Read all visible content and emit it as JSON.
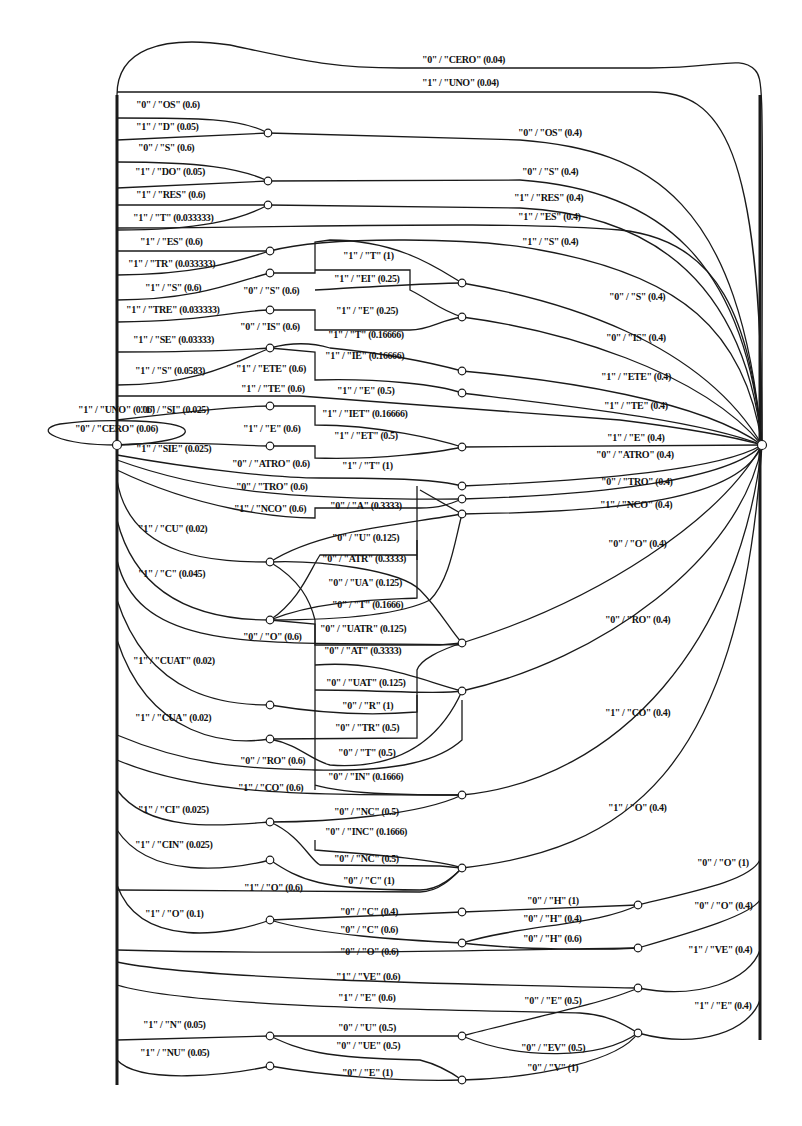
{
  "diagram": {
    "type": "weighted finite-state transducer",
    "colors": {
      "ink": "#1a1a1a",
      "background": "#ffffff"
    },
    "nodes": [
      {
        "id": "start",
        "x": 117,
        "y": 445
      },
      {
        "id": "final",
        "x": 762,
        "y": 445
      },
      {
        "id": "n1",
        "x": 268,
        "y": 133
      },
      {
        "id": "n2",
        "x": 268,
        "y": 181
      },
      {
        "id": "n3",
        "x": 268,
        "y": 205
      },
      {
        "id": "n4",
        "x": 270,
        "y": 251
      },
      {
        "id": "n5",
        "x": 270,
        "y": 273
      },
      {
        "id": "n6",
        "x": 270,
        "y": 310
      },
      {
        "id": "n7",
        "x": 270,
        "y": 348
      },
      {
        "id": "n8",
        "x": 270,
        "y": 406
      },
      {
        "id": "n9",
        "x": 270,
        "y": 446
      },
      {
        "id": "n10",
        "x": 462,
        "y": 283
      },
      {
        "id": "n11",
        "x": 462,
        "y": 317
      },
      {
        "id": "n12",
        "x": 462,
        "y": 371
      },
      {
        "id": "n13",
        "x": 462,
        "y": 393
      },
      {
        "id": "n14",
        "x": 462,
        "y": 447
      },
      {
        "id": "n15",
        "x": 462,
        "y": 486
      },
      {
        "id": "n16",
        "x": 462,
        "y": 499
      },
      {
        "id": "n17",
        "x": 462,
        "y": 514
      },
      {
        "id": "n18",
        "x": 270,
        "y": 562
      },
      {
        "id": "n19",
        "x": 270,
        "y": 620
      },
      {
        "id": "n20",
        "x": 462,
        "y": 643
      },
      {
        "id": "n21",
        "x": 462,
        "y": 691
      },
      {
        "id": "n22",
        "x": 270,
        "y": 705
      },
      {
        "id": "n23",
        "x": 270,
        "y": 739
      },
      {
        "id": "n24",
        "x": 462,
        "y": 795
      },
      {
        "id": "n25",
        "x": 270,
        "y": 822
      },
      {
        "id": "n26",
        "x": 270,
        "y": 860
      },
      {
        "id": "n27",
        "x": 462,
        "y": 868
      },
      {
        "id": "n28",
        "x": 270,
        "y": 920
      },
      {
        "id": "n29",
        "x": 462,
        "y": 912
      },
      {
        "id": "n30",
        "x": 462,
        "y": 943
      },
      {
        "id": "n31",
        "x": 638,
        "y": 905
      },
      {
        "id": "n32",
        "x": 638,
        "y": 948
      },
      {
        "id": "n33",
        "x": 638,
        "y": 988
      },
      {
        "id": "n34",
        "x": 270,
        "y": 1036
      },
      {
        "id": "n35",
        "x": 270,
        "y": 1066
      },
      {
        "id": "n36",
        "x": 462,
        "y": 1036
      },
      {
        "id": "n37",
        "x": 638,
        "y": 1033
      },
      {
        "id": "n38",
        "x": 462,
        "y": 1080
      }
    ],
    "labels": [
      {
        "text": "\"0\" / \"CERO\" (0.04)",
        "x": 422,
        "y": 63
      },
      {
        "text": "\"1\" / \"UNO\" (0.04)",
        "x": 422,
        "y": 86
      },
      {
        "text": "\"0\" / \"OS\" (0.6)",
        "x": 136,
        "y": 108
      },
      {
        "text": "\"1\" / \"D\" (0.05)",
        "x": 136,
        "y": 130
      },
      {
        "text": "\"0\" / \"S\" (0.6)",
        "x": 138,
        "y": 151
      },
      {
        "text": "\"1\" / \"DO\" (0.05)",
        "x": 135,
        "y": 175
      },
      {
        "text": "\"1\" / \"RES\" (0.6)",
        "x": 136,
        "y": 198
      },
      {
        "text": "\"1\" / \"T\" (0.033333)",
        "x": 133,
        "y": 221
      },
      {
        "text": "\"1\" / \"ES\" (0.6)",
        "x": 140,
        "y": 245
      },
      {
        "text": "\"1\" / \"TR\" (0.033333)",
        "x": 128,
        "y": 267
      },
      {
        "text": "\"1\" / \"S\" (0.6)",
        "x": 145,
        "y": 291
      },
      {
        "text": "\"1\" / \"TRE\" (0.033333)",
        "x": 126,
        "y": 313
      },
      {
        "text": "\"1\" / \"SE\" (0.03333)",
        "x": 133,
        "y": 343
      },
      {
        "text": "\"1\" / \"S\" (0.0583)",
        "x": 135,
        "y": 374
      },
      {
        "text": "\"1\" / \"UNO\" (0.06)",
        "x": 78,
        "y": 413
      },
      {
        "text": "\"1\" / \"SI\" (0.025)",
        "x": 140,
        "y": 413
      },
      {
        "text": "\"0\" / \"CERO\" (0.06)",
        "x": 75,
        "y": 432
      },
      {
        "text": "\"1\" / \"SIE\" (0.025)",
        "x": 136,
        "y": 452
      },
      {
        "text": "\"0\" / \"S\" (0.6)",
        "x": 243,
        "y": 294
      },
      {
        "text": "\"0\" / \"IS\" (0.6)",
        "x": 240,
        "y": 330
      },
      {
        "text": "\"1\" / \"ETE\" (0.6)",
        "x": 236,
        "y": 372
      },
      {
        "text": "\"1\" / \"TE\" (0.6)",
        "x": 241,
        "y": 392
      },
      {
        "text": "\"1\" / \"E\" (0.6)",
        "x": 243,
        "y": 432
      },
      {
        "text": "\"0\" / \"ATRO\" (0.6)",
        "x": 232,
        "y": 467
      },
      {
        "text": "\"0\" / \"TRO\" (0.6)",
        "x": 236,
        "y": 490
      },
      {
        "text": "\"1\" / \"NCO\" (0.6)",
        "x": 234,
        "y": 512
      },
      {
        "text": "\"1\" / \"T\" (1)",
        "x": 343,
        "y": 259
      },
      {
        "text": "\"1\" / \"EI\" (0.25)",
        "x": 334,
        "y": 282
      },
      {
        "text": "\"1\" / \"E\" (0.25)",
        "x": 336,
        "y": 314
      },
      {
        "text": "\"1\" / \"T\" (0.16666)",
        "x": 328,
        "y": 338
      },
      {
        "text": "\"1\" / \"IE\" (0.16666)",
        "x": 325,
        "y": 359
      },
      {
        "text": "\"1\" / \"E\" (0.5)",
        "x": 337,
        "y": 394
      },
      {
        "text": "\"1\" / \"IET\" (0.16666)",
        "x": 322,
        "y": 417
      },
      {
        "text": "\"1\" / \"ET\" (0.5)",
        "x": 334,
        "y": 439
      },
      {
        "text": "\"1\" / \"T\" (1)",
        "x": 342,
        "y": 469
      },
      {
        "text": "\"0\" / \"A\" (0.3333)",
        "x": 330,
        "y": 509
      },
      {
        "text": "\"1\" / \"CU\" (0.02)",
        "x": 138,
        "y": 532
      },
      {
        "text": "\"1\" / \"C\" (0.045)",
        "x": 138,
        "y": 577
      },
      {
        "text": "\"0\" / \"U\" (0.125)",
        "x": 332,
        "y": 541
      },
      {
        "text": "\"0\" / \"ATR\" (0.3333)",
        "x": 322,
        "y": 562
      },
      {
        "text": "\"0\" / \"UA\" (0.125)",
        "x": 328,
        "y": 586
      },
      {
        "text": "\"0\" / \"T\" (0.1666)",
        "x": 332,
        "y": 608
      },
      {
        "text": "\"0\" / \"UATR\" (0.125)",
        "x": 320,
        "y": 632
      },
      {
        "text": "\"0\" / \"O\" (0.6)",
        "x": 243,
        "y": 640
      },
      {
        "text": "\"0\" / \"AT\" (0.3333)",
        "x": 324,
        "y": 654
      },
      {
        "text": "\"1\" / \"CUAT\" (0.02)",
        "x": 133,
        "y": 664
      },
      {
        "text": "\"0\" / \"UAT\" (0.125)",
        "x": 326,
        "y": 686
      },
      {
        "text": "\"0\" / \"R\" (1)",
        "x": 342,
        "y": 709
      },
      {
        "text": "\"1\" / \"CUA\" (0.02)",
        "x": 135,
        "y": 721
      },
      {
        "text": "\"0\" / \"TR\" (0.5)",
        "x": 335,
        "y": 731
      },
      {
        "text": "\"0\" / \"T\" (0.5)",
        "x": 338,
        "y": 756
      },
      {
        "text": "\"0\" / \"RO\" (0.6)",
        "x": 240,
        "y": 764
      },
      {
        "text": "\"0\" / \"IN\" (0.1666)",
        "x": 328,
        "y": 780
      },
      {
        "text": "\"1\" / \"CO\" (0.6)",
        "x": 238,
        "y": 791
      },
      {
        "text": "\"1\" / \"CI\" (0.025)",
        "x": 138,
        "y": 813
      },
      {
        "text": "\"0\" / \"NC\" (0.5)",
        "x": 334,
        "y": 815
      },
      {
        "text": "\"0\" / \"INC\" (0.1666)",
        "x": 325,
        "y": 835
      },
      {
        "text": "\"1\" / \"CIN\" (0.025)",
        "x": 135,
        "y": 848
      },
      {
        "text": "\"0\" / \"NC\" (0.5)",
        "x": 334,
        "y": 862
      },
      {
        "text": "\"0\" / \"C\" (1)",
        "x": 343,
        "y": 884
      },
      {
        "text": "\"1\" / \"O\" (0.6)",
        "x": 244,
        "y": 891
      },
      {
        "text": "\"1\" / \"O\" (0.1)",
        "x": 145,
        "y": 917
      },
      {
        "text": "\"0\" / \"C\" (0.4)",
        "x": 340,
        "y": 915
      },
      {
        "text": "\"0\" / \"C\" (0.6)",
        "x": 340,
        "y": 933
      },
      {
        "text": "\"0\" / \"O\" (0.6)",
        "x": 340,
        "y": 955
      },
      {
        "text": "\"1\" / \"VE\" (0.6)",
        "x": 336,
        "y": 980
      },
      {
        "text": "\"1\" / \"E\" (0.6)",
        "x": 338,
        "y": 1001
      },
      {
        "text": "\"1\" / \"N\" (0.05)",
        "x": 143,
        "y": 1028
      },
      {
        "text": "\"1\" / \"NU\" (0.05)",
        "x": 140,
        "y": 1056
      },
      {
        "text": "\"0\" / \"U\" (0.5)",
        "x": 338,
        "y": 1031
      },
      {
        "text": "\"0\" / \"UE\" (0.5)",
        "x": 336,
        "y": 1049
      },
      {
        "text": "\"0\" / \"E\" (1)",
        "x": 342,
        "y": 1076
      },
      {
        "text": "\"0\" / \"OS\" (0.4)",
        "x": 518,
        "y": 136
      },
      {
        "text": "\"0\" / \"S\" (0.4)",
        "x": 522,
        "y": 175
      },
      {
        "text": "\"1\" / \"RES\" (0.4)",
        "x": 514,
        "y": 201
      },
      {
        "text": "\"1\" / \"ES\" (0.4)",
        "x": 518,
        "y": 220
      },
      {
        "text": "\"1\" / \"S\" (0.4)",
        "x": 522,
        "y": 245
      },
      {
        "text": "\"0\" / \"S\" (0.4)",
        "x": 609,
        "y": 300
      },
      {
        "text": "\"0\" / \"IS\" (0.4)",
        "x": 606,
        "y": 341
      },
      {
        "text": "\"1\" / \"ETE\" (0.4)",
        "x": 601,
        "y": 380
      },
      {
        "text": "\"1\" / \"TE\" (0.4)",
        "x": 604,
        "y": 409
      },
      {
        "text": "\"1\" / \"E\" (0.4)",
        "x": 607,
        "y": 441
      },
      {
        "text": "\"0\" / \"ATRO\" (0.4)",
        "x": 596,
        "y": 458
      },
      {
        "text": "\"0\" / \"TRO\" (0.4)",
        "x": 601,
        "y": 485
      },
      {
        "text": "\"1\" / \"NCO\" (0.4)",
        "x": 600,
        "y": 508
      },
      {
        "text": "\"0\" / \"O\" (0.4)",
        "x": 608,
        "y": 547
      },
      {
        "text": "\"0\" / \"RO\" (0.4)",
        "x": 605,
        "y": 623
      },
      {
        "text": "\"1\" / \"CO\" (0.4)",
        "x": 605,
        "y": 716
      },
      {
        "text": "\"1\" / \"O\" (0.4)",
        "x": 608,
        "y": 811
      },
      {
        "text": "\"0\" / \"O\" (1)",
        "x": 697,
        "y": 866
      },
      {
        "text": "\"0\" / \"H\" (1)",
        "x": 527,
        "y": 904
      },
      {
        "text": "\"0\" / \"H\" (0.4)",
        "x": 523,
        "y": 922
      },
      {
        "text": "\"0\" / \"O\" (0.4)",
        "x": 694,
        "y": 909
      },
      {
        "text": "\"0\" / \"H\" (0.6)",
        "x": 523,
        "y": 942
      },
      {
        "text": "\"1\" / \"VE\" (0.4)",
        "x": 688,
        "y": 953
      },
      {
        "text": "\"0\" / \"E\" (0.5)",
        "x": 524,
        "y": 1004
      },
      {
        "text": "\"1\" / \"E\" (0.4)",
        "x": 694,
        "y": 1009
      },
      {
        "text": "\"0\" / \"EV\" (0.5)",
        "x": 521,
        "y": 1051
      },
      {
        "text": "\"0\" / \"V\" (1)",
        "x": 527,
        "y": 1071
      }
    ]
  }
}
